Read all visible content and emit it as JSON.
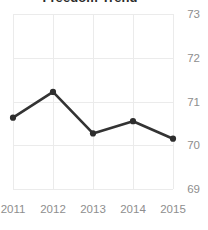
{
  "chart_data": {
    "type": "line",
    "title": "Freedom Trend",
    "xlabel": "",
    "ylabel": "",
    "x": [
      "2011",
      "2012",
      "2013",
      "2014",
      "2015"
    ],
    "categories": [
      "2011",
      "2012",
      "2013",
      "2014",
      "2015"
    ],
    "values": [
      70.63,
      71.22,
      70.27,
      70.55,
      70.15
    ],
    "series": [
      {
        "name": "Freedom Score",
        "values": [
          70.63,
          71.22,
          70.27,
          70.55,
          70.15
        ]
      }
    ],
    "xtick_labels": [
      "2011",
      "2012",
      "2013",
      "2014",
      "2015"
    ],
    "ytick_labels": [
      "73",
      "72",
      "71",
      "70",
      "69"
    ],
    "ytick_values": [
      73,
      72,
      71,
      70,
      69
    ],
    "ylim": [
      69,
      73
    ],
    "grid": true,
    "grid_axis": "both",
    "legend": false,
    "legend_position": "none",
    "yaxis_side": "right",
    "markers": "circle",
    "colors": {
      "line": "#333333",
      "marker": "#2e2e2e",
      "grid": "#ebebeb",
      "tick_label": "#8e8e8e",
      "title": "#2b2b2b",
      "background": "#ffffff"
    }
  }
}
